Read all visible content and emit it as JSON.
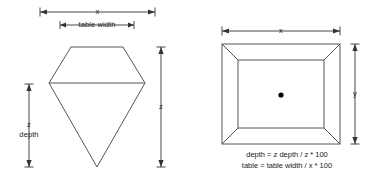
{
  "diagram": {
    "background_color": "#ffffff",
    "line_color": "#555555",
    "dimension_color": "#333333",
    "text_color": "#1a1a1a"
  },
  "side_view": {
    "name": "side profile view of gemstone",
    "dimensions": {
      "width_label": "x",
      "table_width_label": "table width",
      "z_depth_label_line1": "z",
      "z_depth_label_line2": "depth",
      "total_depth_label": "z"
    }
  },
  "top_view": {
    "name": "top view of gemstone",
    "dimensions": {
      "width_label": "x",
      "height_label": "y"
    },
    "center_marker": "center-point-dot"
  },
  "formulas": {
    "depth": "depth = z depth / z * 100",
    "table": "table = table width / x * 100"
  }
}
